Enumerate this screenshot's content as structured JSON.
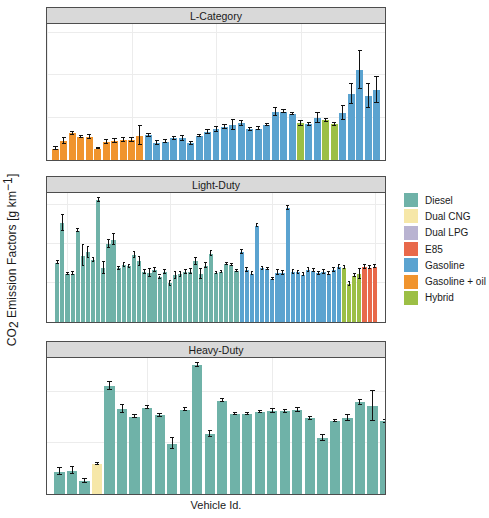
{
  "chart_data": {
    "type": "bar",
    "title": "",
    "xlabel": "Vehicle Id.",
    "ylabel": "CO2 Emission Factors [g km-1]",
    "ylabel_parts": {
      "pre": "CO",
      "sub": "2",
      "mid": " Emission Factors [g km",
      "sup": "−1",
      "post": "]"
    },
    "grid": true,
    "legend_position": "right",
    "legend_title": "",
    "colors": {
      "Diesel": "#6fb2a8",
      "Dual CNG": "#f6e7a8",
      "Dual LPG": "#b9b3d1",
      "E85": "#e8694a",
      "Gasoline": "#5ba3d0",
      "Gasoline + oil": "#f0942e",
      "Hybrid": "#9cbf45"
    },
    "legend": [
      {
        "label": "Diesel",
        "color": "#6fb2a8"
      },
      {
        "label": "Dual CNG",
        "color": "#f6e7a8"
      },
      {
        "label": "Dual LPG",
        "color": "#b9b3d1"
      },
      {
        "label": "E85",
        "color": "#e8694a"
      },
      {
        "label": "Gasoline",
        "color": "#5ba3d0"
      },
      {
        "label": "Gasoline + oil",
        "color": "#f0942e"
      },
      {
        "label": "Hybrid",
        "color": "#9cbf45"
      }
    ],
    "panels": [
      {
        "name": "L-Category",
        "title": "L-Category",
        "ylim": [
          0,
          320
        ],
        "yticks": [
          0,
          100,
          200,
          300
        ],
        "xlim": [
          0,
          40
        ],
        "xticks": [
          0,
          10,
          20,
          30,
          40
        ],
        "bars": [
          {
            "x": 1,
            "value": 27,
            "err": 4,
            "fuel": "Gasoline + oil"
          },
          {
            "x": 2,
            "value": 45,
            "err": 7,
            "fuel": "Gasoline + oil"
          },
          {
            "x": 3,
            "value": 63,
            "err": 3,
            "fuel": "Gasoline + oil"
          },
          {
            "x": 4,
            "value": 54,
            "err": 3,
            "fuel": "Gasoline + oil"
          },
          {
            "x": 5,
            "value": 55,
            "err": 5,
            "fuel": "Gasoline + oil"
          },
          {
            "x": 6,
            "value": 27,
            "err": 2,
            "fuel": "Gasoline + oil"
          },
          {
            "x": 7,
            "value": 42,
            "err": 4,
            "fuel": "Gasoline + oil"
          },
          {
            "x": 8,
            "value": 45,
            "err": 4,
            "fuel": "Gasoline + oil"
          },
          {
            "x": 9,
            "value": 47,
            "err": 4,
            "fuel": "Gasoline + oil"
          },
          {
            "x": 10,
            "value": 47,
            "err": 4,
            "fuel": "Gasoline + oil"
          },
          {
            "x": 11,
            "value": 57,
            "err": 22,
            "fuel": "Gasoline + oil"
          },
          {
            "x": 12,
            "value": 58,
            "err": 3,
            "fuel": "Gasoline"
          },
          {
            "x": 13,
            "value": 40,
            "err": 5,
            "fuel": "Gasoline"
          },
          {
            "x": 14,
            "value": 43,
            "err": 4,
            "fuel": "Gasoline"
          },
          {
            "x": 15,
            "value": 51,
            "err": 3,
            "fuel": "Gasoline"
          },
          {
            "x": 16,
            "value": 51,
            "err": 6,
            "fuel": "Gasoline"
          },
          {
            "x": 17,
            "value": 39,
            "err": 3,
            "fuel": "Gasoline"
          },
          {
            "x": 18,
            "value": 57,
            "err": 3,
            "fuel": "Gasoline"
          },
          {
            "x": 19,
            "value": 66,
            "err": 4,
            "fuel": "Gasoline"
          },
          {
            "x": 20,
            "value": 72,
            "err": 5,
            "fuel": "Gasoline"
          },
          {
            "x": 21,
            "value": 78,
            "err": 4,
            "fuel": "Gasoline"
          },
          {
            "x": 22,
            "value": 82,
            "err": 11,
            "fuel": "Gasoline"
          },
          {
            "x": 23,
            "value": 86,
            "err": 5,
            "fuel": "Gasoline"
          },
          {
            "x": 24,
            "value": 72,
            "err": 4,
            "fuel": "Gasoline"
          },
          {
            "x": 25,
            "value": 74,
            "err": 3,
            "fuel": "Gasoline"
          },
          {
            "x": 26,
            "value": 82,
            "err": 3,
            "fuel": "Gasoline"
          },
          {
            "x": 27,
            "value": 113,
            "err": 10,
            "fuel": "Gasoline"
          },
          {
            "x": 28,
            "value": 114,
            "err": 4,
            "fuel": "Gasoline"
          },
          {
            "x": 29,
            "value": 108,
            "err": 3,
            "fuel": "Gasoline"
          },
          {
            "x": 30,
            "value": 86,
            "err": 5,
            "fuel": "Hybrid"
          },
          {
            "x": 31,
            "value": 84,
            "err": 3,
            "fuel": "Gasoline"
          },
          {
            "x": 32,
            "value": 99,
            "err": 11,
            "fuel": "Gasoline"
          },
          {
            "x": 33,
            "value": 93,
            "err": 4,
            "fuel": "Hybrid"
          },
          {
            "x": 34,
            "value": 84,
            "err": 4,
            "fuel": "Hybrid"
          },
          {
            "x": 35,
            "value": 110,
            "err": 17,
            "fuel": "Gasoline"
          },
          {
            "x": 36,
            "value": 156,
            "err": 24,
            "fuel": "Gasoline"
          },
          {
            "x": 37,
            "value": 212,
            "err": 45,
            "fuel": "Gasoline"
          },
          {
            "x": 38,
            "value": 150,
            "err": 28,
            "fuel": "Gasoline"
          },
          {
            "x": 39,
            "value": 165,
            "err": 30,
            "fuel": "Gasoline"
          }
        ]
      },
      {
        "name": "Light-Duty",
        "title": "Light-Duty",
        "ylim": [
          0,
          330
        ],
        "yticks": [
          0,
          100,
          200,
          300
        ],
        "xlim": [
          36,
          102
        ],
        "xticks": [
          40,
          80,
          80,
          100
        ],
        "xtickvals": [
          40,
          60,
          80,
          100
        ],
        "bars": [
          {
            "x": 38,
            "value": 152,
            "err": 4,
            "fuel": "Diesel"
          },
          {
            "x": 39,
            "value": 253,
            "err": 20,
            "fuel": "Diesel"
          },
          {
            "x": 40,
            "value": 123,
            "err": 3,
            "fuel": "Diesel"
          },
          {
            "x": 41,
            "value": 124,
            "err": 3,
            "fuel": "Diesel"
          },
          {
            "x": 42,
            "value": 234,
            "err": 4,
            "fuel": "Diesel"
          },
          {
            "x": 43,
            "value": 170,
            "err": 26,
            "fuel": "Diesel"
          },
          {
            "x": 44,
            "value": 178,
            "err": 14,
            "fuel": "Diesel"
          },
          {
            "x": 45,
            "value": 159,
            "err": 5,
            "fuel": "Diesel"
          },
          {
            "x": 46,
            "value": 313,
            "err": 5,
            "fuel": "Diesel"
          },
          {
            "x": 47,
            "value": 138,
            "err": 16,
            "fuel": "Diesel"
          },
          {
            "x": 48,
            "value": 200,
            "err": 10,
            "fuel": "Diesel"
          },
          {
            "x": 49,
            "value": 211,
            "err": 13,
            "fuel": "Diesel"
          },
          {
            "x": 50,
            "value": 137,
            "err": 4,
            "fuel": "Diesel"
          },
          {
            "x": 51,
            "value": 146,
            "err": 5,
            "fuel": "Diesel"
          },
          {
            "x": 52,
            "value": 143,
            "err": 4,
            "fuel": "Diesel"
          },
          {
            "x": 53,
            "value": 172,
            "err": 8,
            "fuel": "Diesel"
          },
          {
            "x": 54,
            "value": 155,
            "err": 12,
            "fuel": "Diesel"
          },
          {
            "x": 55,
            "value": 128,
            "err": 5,
            "fuel": "Diesel"
          },
          {
            "x": 56,
            "value": 125,
            "err": 10,
            "fuel": "Diesel"
          },
          {
            "x": 57,
            "value": 132,
            "err": 5,
            "fuel": "Diesel"
          },
          {
            "x": 58,
            "value": 114,
            "err": 5,
            "fuel": "Diesel"
          },
          {
            "x": 59,
            "value": 129,
            "err": 5,
            "fuel": "Diesel"
          },
          {
            "x": 60,
            "value": 99,
            "err": 7,
            "fuel": "Diesel"
          },
          {
            "x": 61,
            "value": 119,
            "err": 8,
            "fuel": "Diesel"
          },
          {
            "x": 62,
            "value": 122,
            "err": 6,
            "fuel": "Diesel"
          },
          {
            "x": 63,
            "value": 127,
            "err": 5,
            "fuel": "Diesel"
          },
          {
            "x": 64,
            "value": 129,
            "err": 7,
            "fuel": "Diesel"
          },
          {
            "x": 65,
            "value": 155,
            "err": 8,
            "fuel": "Diesel"
          },
          {
            "x": 66,
            "value": 123,
            "err": 13,
            "fuel": "Diesel"
          },
          {
            "x": 67,
            "value": 144,
            "err": 7,
            "fuel": "Diesel"
          },
          {
            "x": 68,
            "value": 175,
            "err": 6,
            "fuel": "Diesel"
          },
          {
            "x": 69,
            "value": 126,
            "err": 3,
            "fuel": "Diesel"
          },
          {
            "x": 70,
            "value": 128,
            "err": 3,
            "fuel": "Diesel"
          },
          {
            "x": 71,
            "value": 148,
            "err": 3,
            "fuel": "Diesel"
          },
          {
            "x": 72,
            "value": 146,
            "err": 3,
            "fuel": "Diesel"
          },
          {
            "x": 73,
            "value": 130,
            "err": 3,
            "fuel": "Diesel"
          },
          {
            "x": 74,
            "value": 180,
            "err": 5,
            "fuel": "Gasoline"
          },
          {
            "x": 75,
            "value": 133,
            "err": 4,
            "fuel": "Gasoline"
          },
          {
            "x": 76,
            "value": 124,
            "err": 3,
            "fuel": "Gasoline"
          },
          {
            "x": 77,
            "value": 246,
            "err": 4,
            "fuel": "Gasoline"
          },
          {
            "x": 78,
            "value": 137,
            "err": 3,
            "fuel": "Gasoline"
          },
          {
            "x": 79,
            "value": 136,
            "err": 3,
            "fuel": "Gasoline"
          },
          {
            "x": 80,
            "value": 110,
            "err": 3,
            "fuel": "Gasoline"
          },
          {
            "x": 81,
            "value": 126,
            "err": 6,
            "fuel": "Gasoline"
          },
          {
            "x": 82,
            "value": 125,
            "err": 6,
            "fuel": "Gasoline"
          },
          {
            "x": 83,
            "value": 291,
            "err": 5,
            "fuel": "Gasoline"
          },
          {
            "x": 84,
            "value": 128,
            "err": 4,
            "fuel": "Gasoline"
          },
          {
            "x": 85,
            "value": 127,
            "err": 4,
            "fuel": "Gasoline"
          },
          {
            "x": 86,
            "value": 121,
            "err": 4,
            "fuel": "Gasoline"
          },
          {
            "x": 87,
            "value": 133,
            "err": 5,
            "fuel": "Gasoline"
          },
          {
            "x": 88,
            "value": 131,
            "err": 4,
            "fuel": "Gasoline"
          },
          {
            "x": 89,
            "value": 125,
            "err": 4,
            "fuel": "Gasoline"
          },
          {
            "x": 90,
            "value": 128,
            "err": 4,
            "fuel": "Gasoline"
          },
          {
            "x": 91,
            "value": 124,
            "err": 5,
            "fuel": "Gasoline"
          },
          {
            "x": 92,
            "value": 132,
            "err": 5,
            "fuel": "Gasoline"
          },
          {
            "x": 93,
            "value": 140,
            "err": 5,
            "fuel": "Gasoline"
          },
          {
            "x": 94,
            "value": 139,
            "err": 4,
            "fuel": "Hybrid"
          },
          {
            "x": 95,
            "value": 98,
            "err": 5,
            "fuel": "Hybrid"
          },
          {
            "x": 96,
            "value": 118,
            "err": 4,
            "fuel": "Hybrid"
          },
          {
            "x": 97,
            "value": 123,
            "err": 12,
            "fuel": "Hybrid"
          },
          {
            "x": 98,
            "value": 141,
            "err": 6,
            "fuel": "E85"
          },
          {
            "x": 99,
            "value": 139,
            "err": 4,
            "fuel": "E85"
          },
          {
            "x": 100,
            "value": 142,
            "err": 5,
            "fuel": "E85"
          }
        ]
      },
      {
        "name": "Heavy-Duty",
        "title": "Heavy-Duty",
        "ylim": [
          0,
          1330
        ],
        "yticks": [
          0,
          500,
          1000
        ],
        "xlim": [
          102,
          129
        ],
        "xticks": [
          110,
          120
        ],
        "bars": [
          {
            "x": 103,
            "value": 218,
            "err": 35,
            "fuel": "Diesel"
          },
          {
            "x": 104,
            "value": 228,
            "err": 32,
            "fuel": "Diesel"
          },
          {
            "x": 105,
            "value": 128,
            "err": 18,
            "fuel": "Diesel"
          },
          {
            "x": 106,
            "value": 296,
            "err": 12,
            "fuel": "Dual CNG"
          },
          {
            "x": 107,
            "value": 1058,
            "err": 40,
            "fuel": "Diesel"
          },
          {
            "x": 108,
            "value": 833,
            "err": 42,
            "fuel": "Diesel"
          },
          {
            "x": 109,
            "value": 757,
            "err": 16,
            "fuel": "Diesel"
          },
          {
            "x": 110,
            "value": 843,
            "err": 13,
            "fuel": "Diesel"
          },
          {
            "x": 111,
            "value": 768,
            "err": 14,
            "fuel": "Diesel"
          },
          {
            "x": 112,
            "value": 492,
            "err": 52,
            "fuel": "Diesel"
          },
          {
            "x": 113,
            "value": 824,
            "err": 14,
            "fuel": "Diesel"
          },
          {
            "x": 114,
            "value": 1263,
            "err": 16,
            "fuel": "Diesel"
          },
          {
            "x": 115,
            "value": 585,
            "err": 30,
            "fuel": "Diesel"
          },
          {
            "x": 116,
            "value": 913,
            "err": 12,
            "fuel": "Diesel"
          },
          {
            "x": 117,
            "value": 782,
            "err": 10,
            "fuel": "Diesel"
          },
          {
            "x": 118,
            "value": 784,
            "err": 12,
            "fuel": "Diesel"
          },
          {
            "x": 119,
            "value": 800,
            "err": 12,
            "fuel": "Diesel"
          },
          {
            "x": 120,
            "value": 812,
            "err": 22,
            "fuel": "Diesel"
          },
          {
            "x": 121,
            "value": 808,
            "err": 18,
            "fuel": "Diesel"
          },
          {
            "x": 122,
            "value": 820,
            "err": 22,
            "fuel": "Diesel"
          },
          {
            "x": 123,
            "value": 740,
            "err": 14,
            "fuel": "Diesel"
          },
          {
            "x": 124,
            "value": 548,
            "err": 26,
            "fuel": "Diesel"
          },
          {
            "x": 125,
            "value": 718,
            "err": 10,
            "fuel": "Diesel"
          },
          {
            "x": 126,
            "value": 742,
            "err": 30,
            "fuel": "Diesel"
          },
          {
            "x": 127,
            "value": 895,
            "err": 24,
            "fuel": "Diesel"
          },
          {
            "x": 128,
            "value": 860,
            "err": 150,
            "fuel": "Diesel"
          },
          {
            "x": 129,
            "value": 710,
            "err": 12,
            "fuel": "Diesel"
          },
          {
            "x": 130,
            "value": 345,
            "err": 45,
            "fuel": "Dual CNG"
          },
          {
            "x": 131,
            "value": 772,
            "err": 14,
            "fuel": "Dual LPG"
          }
        ]
      }
    ]
  }
}
